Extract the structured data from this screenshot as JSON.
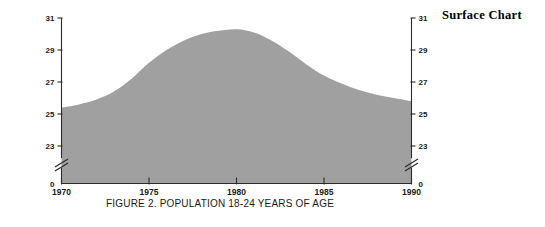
{
  "heading": {
    "label": "Surface Chart"
  },
  "figure": {
    "caption": "FIGURE 2. POPULATION 18-24 YEARS OF AGE",
    "y_axis_title": "Millions",
    "area_fill_color": "#a0a0a0",
    "axis_color": "#2b2b2b",
    "background_color": "#ffffff"
  },
  "chart_data": {
    "type": "area",
    "title": "FIGURE 2. POPULATION 18-24 YEARS OF AGE",
    "subtitle": "",
    "xlabel": "",
    "ylabel": "Millions",
    "x": [
      1970,
      1971,
      1972,
      1973,
      1974,
      1975,
      1976,
      1977,
      1978,
      1979,
      1980,
      1981,
      1982,
      1983,
      1984,
      1985,
      1986,
      1987,
      1988,
      1989,
      1990
    ],
    "values": [
      25.4,
      25.6,
      25.9,
      26.4,
      27.2,
      28.2,
      29.0,
      29.6,
      30.0,
      30.2,
      30.3,
      30.1,
      29.6,
      28.9,
      28.1,
      27.4,
      26.9,
      26.5,
      26.2,
      26.0,
      25.8
    ],
    "series": [
      {
        "name": "Population 18-24 years of age",
        "values": [
          25.4,
          25.6,
          25.9,
          26.4,
          27.2,
          28.2,
          29.0,
          29.6,
          30.0,
          30.2,
          30.3,
          30.1,
          29.6,
          28.9,
          28.1,
          27.4,
          26.9,
          26.5,
          26.2,
          26.0,
          25.8
        ]
      }
    ],
    "y_ticks": [
      "31",
      "29",
      "27",
      "25",
      "23",
      "0"
    ],
    "y_tick_values": [
      31,
      29,
      27,
      25,
      23,
      0
    ],
    "x_ticks": [
      "1970",
      "1975",
      "1980",
      "1985",
      "1990"
    ],
    "x_tick_values": [
      1970,
      1975,
      1980,
      1985,
      1990
    ],
    "ylim": [
      23,
      31
    ],
    "xlim": [
      1970,
      1990
    ],
    "y_axis_break": true,
    "y_axis_break_note": "axis break between 0 and 23",
    "grid": false,
    "legend": false,
    "legend_position": "none",
    "dual_y_axis": true,
    "fill_color": "#a0a0a0"
  }
}
